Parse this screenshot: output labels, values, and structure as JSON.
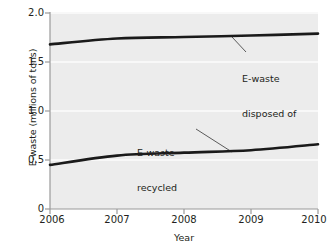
{
  "chart_data": {
    "type": "line",
    "title": "",
    "xlabel": "Year",
    "ylabel": "E-waste (millions of tons)",
    "x": [
      2006,
      2007,
      2008,
      2009,
      2010
    ],
    "xlim": [
      2006,
      2010
    ],
    "ylim": [
      0,
      2.0
    ],
    "xticks": [
      "2006",
      "2007",
      "2008",
      "2009",
      "2010"
    ],
    "yticks": [
      "0",
      "0.5",
      "1.0",
      "1.5",
      "2.0"
    ],
    "ytick_values": [
      0,
      0.5,
      1.0,
      1.5,
      2.0
    ],
    "grid": "horizontal-white-gridlines",
    "legend": "inline-annotations-with-leader-lines",
    "series": [
      {
        "name": "E-waste disposed of",
        "values": [
          1.68,
          1.74,
          1.755,
          1.77,
          1.79
        ],
        "color": "#1a1a1a"
      },
      {
        "name": "E-waste recycled",
        "values": [
          0.45,
          0.545,
          0.575,
          0.6,
          0.66
        ],
        "color": "#1a1a1a"
      }
    ],
    "annotations": [
      {
        "id": "disposed",
        "line1": "E-waste",
        "line2": "disposed of"
      },
      {
        "id": "recycled",
        "line1": "E-waste",
        "line2": "recycled"
      }
    ],
    "colors": {
      "plot_background": "#ececec",
      "gridline": "#f7f7f7",
      "axis": "#8d8d8d",
      "line": "#1a1a1a",
      "text": "#231f20",
      "leader": "#4a4a4a"
    }
  }
}
